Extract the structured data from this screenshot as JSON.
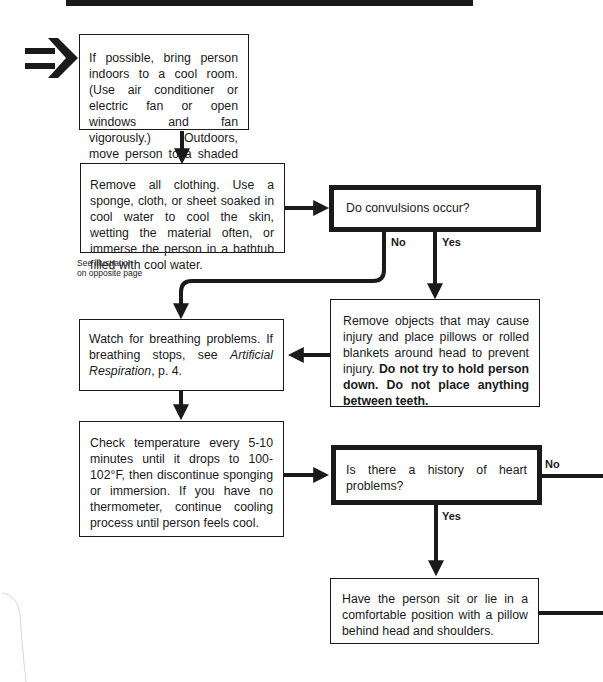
{
  "diagram": {
    "type": "flowchart",
    "start_marker": "double-arrow-icon",
    "boxes": {
      "step1": {
        "text": "If possible, bring person indoors to a cool room. (Use air conditioner or electric fan or open windows and fan vigorously.) Outdoors, move person to a shaded area."
      },
      "step2": {
        "text": "Remove all clothing. Use a sponge, cloth, or sheet soaked in cool water to cool the skin, wetting the material often, or immerse the person in a bathtub filled with cool water."
      },
      "note": {
        "line1": "See illustration",
        "line2": "on opposite page"
      },
      "decision1": {
        "text": "Do convulsions occur?",
        "no_label": "No",
        "yes_label": "Yes"
      },
      "convulsion_action": {
        "text_plain": "Remove objects that may cause injury and place pillows or rolled blankets around head to prevent injury.",
        "text_bold": "Do not try to hold person down. Do not place anything between teeth."
      },
      "step3": {
        "text_plain": "Watch for breathing problems. If breathing stops, see",
        "text_italic": "Artificial Respiration",
        "text_tail": ", p. 4."
      },
      "step4": {
        "text": "Check temperature every 5-10 minutes until it drops to 100-102°F, then discontinue sponging or immersion. If you have no thermometer, continue cooling process until person feels cool."
      },
      "decision2": {
        "text": "Is there a history of heart problems?",
        "no_label": "No",
        "yes_label": "Yes"
      },
      "heart_action": {
        "text": "Have the person sit or lie in a comfortable position with a pillow behind head and shoulders."
      }
    },
    "colors": {
      "ink": "#1a1a1a",
      "paper": "#ffffff"
    }
  }
}
